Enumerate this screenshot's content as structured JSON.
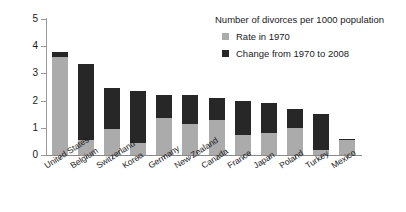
{
  "chart_data": {
    "type": "bar",
    "stacked": true,
    "title": "Number of divorces per 1000 population",
    "xlabel": "",
    "ylabel": "",
    "ylim": [
      0,
      5
    ],
    "yticks": [
      "0",
      "1",
      "2",
      "3",
      "4",
      "5"
    ],
    "grid": false,
    "legend_position": "top-right-inside",
    "categories": [
      "United States",
      "Belgium",
      "Switzerland",
      "Korea",
      "Germany",
      "New Zealand",
      "Canada",
      "France",
      "Japan",
      "Poland",
      "Turkey",
      "Mexico"
    ],
    "series": [
      {
        "name": "Rate in 1970",
        "color": "#ababab",
        "values": [
          3.6,
          0.55,
          0.95,
          0.45,
          1.35,
          1.15,
          1.3,
          0.75,
          0.8,
          1.0,
          0.2,
          0.55
        ]
      },
      {
        "name": "Change from 1970 to 2008",
        "color": "#272727",
        "values": [
          0.2,
          2.8,
          1.5,
          1.9,
          0.85,
          1.05,
          0.8,
          1.25,
          1.1,
          0.7,
          1.3,
          0.05
        ]
      }
    ],
    "totals": [
      3.8,
      3.35,
      2.45,
      2.35,
      2.2,
      2.2,
      2.1,
      2.0,
      1.9,
      1.7,
      1.5,
      0.6
    ]
  },
  "legend": {
    "title": "Number of divorces per 1000 population",
    "items": [
      {
        "label": "Rate in 1970",
        "color": "#ababab"
      },
      {
        "label": "Change from 1970 to 2008",
        "color": "#272727"
      }
    ]
  },
  "colors": {
    "base_series": "#ababab",
    "delta_series": "#272727",
    "axis": "#8a8a8a",
    "text": "#1a1a1a",
    "background": "#ffffff"
  }
}
